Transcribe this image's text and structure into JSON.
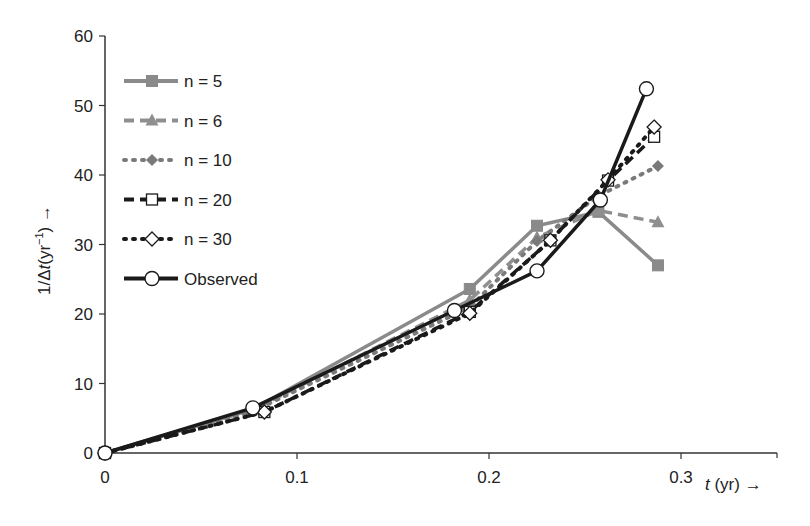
{
  "chart_data": {
    "type": "line",
    "title": "",
    "xlabel": "t (yr) →",
    "ylabel": "1/Δt(yr⁻¹) →",
    "xlim": [
      0,
      0.35
    ],
    "ylim": [
      0,
      60
    ],
    "xticks": [
      0,
      0.1,
      0.2,
      0.3
    ],
    "xtick_labels": [
      "0",
      "0.1",
      "0.2",
      "0.3"
    ],
    "yticks": [
      0,
      10,
      20,
      30,
      40,
      50,
      60
    ],
    "ytick_labels": [
      "0",
      "10",
      "20",
      "30",
      "40",
      "50",
      "60"
    ],
    "grid": false,
    "legend_position": "upper left",
    "series": [
      {
        "name": "n = 5",
        "color": "#8a8a8a",
        "dash": "solid",
        "marker": "square",
        "x": [
          0,
          0.077,
          0.19,
          0.225,
          0.257,
          0.288
        ],
        "y": [
          0,
          6.3,
          23.6,
          32.7,
          34.7,
          27.0
        ]
      },
      {
        "name": "n = 6",
        "color": "#8f8f8f",
        "dash": "dashed",
        "marker": "triangle",
        "x": [
          0,
          0.077,
          0.19,
          0.225,
          0.257,
          0.288
        ],
        "y": [
          0,
          6.2,
          22.0,
          31.0,
          34.9,
          33.2
        ]
      },
      {
        "name": "n = 10",
        "color": "#7a7a7a",
        "dash": "dotted",
        "marker": "diamond-filled",
        "x": [
          0,
          0.077,
          0.19,
          0.225,
          0.257,
          0.288
        ],
        "y": [
          0,
          6.0,
          21.0,
          30.5,
          37.0,
          41.3
        ]
      },
      {
        "name": "n = 20",
        "color": "#1a1a1a",
        "dash": "dashed",
        "marker": "square-open",
        "x": [
          0,
          0.083,
          0.19,
          0.232,
          0.262,
          0.286
        ],
        "y": [
          0,
          5.9,
          20.3,
          30.6,
          39.2,
          45.5
        ]
      },
      {
        "name": "n = 30",
        "color": "#1a1a1a",
        "dash": "dotted",
        "marker": "diamond-open",
        "x": [
          0,
          0.083,
          0.19,
          0.232,
          0.262,
          0.286
        ],
        "y": [
          0,
          5.9,
          20.1,
          30.6,
          39.3,
          46.9
        ]
      },
      {
        "name": "Observed",
        "color": "#1a1a1a",
        "dash": "solid",
        "marker": "circle-open",
        "x": [
          0,
          0.077,
          0.182,
          0.225,
          0.258,
          0.282
        ],
        "y": [
          0,
          6.5,
          20.5,
          26.2,
          36.4,
          52.4
        ]
      }
    ]
  }
}
